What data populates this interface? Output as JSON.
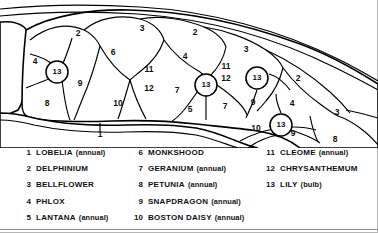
{
  "diagram": {
    "path_label": "1",
    "beds": [
      {
        "id": "b1",
        "label": "4",
        "x": 35,
        "y": 62
      },
      {
        "id": "b2",
        "label": "2",
        "x": 78,
        "y": 34
      },
      {
        "id": "b3",
        "label": "3",
        "x": 142,
        "y": 29
      },
      {
        "id": "b4",
        "label": "2",
        "x": 195,
        "y": 33
      },
      {
        "id": "b5",
        "label": "3",
        "x": 246,
        "y": 50
      },
      {
        "id": "b6",
        "label": "6",
        "x": 113,
        "y": 53
      },
      {
        "id": "b7",
        "label": "4",
        "x": 185,
        "y": 57
      },
      {
        "id": "b8",
        "label": "11",
        "x": 149,
        "y": 70
      },
      {
        "id": "b9",
        "label": "12",
        "x": 149,
        "y": 89
      },
      {
        "id": "b10",
        "label": "11",
        "x": 226,
        "y": 67
      },
      {
        "id": "b11",
        "label": "12",
        "x": 226,
        "y": 79
      },
      {
        "id": "b12",
        "label": "9",
        "x": 80,
        "y": 84
      },
      {
        "id": "b13",
        "label": "8",
        "x": 47,
        "y": 104
      },
      {
        "id": "b14",
        "label": "10",
        "x": 118,
        "y": 104
      },
      {
        "id": "b15",
        "label": "7",
        "x": 177,
        "y": 91
      },
      {
        "id": "b16",
        "label": "5",
        "x": 190,
        "y": 110
      },
      {
        "id": "b17",
        "label": "7",
        "x": 225,
        "y": 107
      },
      {
        "id": "b18",
        "label": "9",
        "x": 253,
        "y": 103
      },
      {
        "id": "b19",
        "label": "2",
        "x": 298,
        "y": 79
      },
      {
        "id": "b20",
        "label": "4",
        "x": 292,
        "y": 104
      },
      {
        "id": "b21",
        "label": "3",
        "x": 337,
        "y": 113
      },
      {
        "id": "b22",
        "label": "10",
        "x": 256,
        "y": 129
      },
      {
        "id": "b23",
        "label": "9",
        "x": 293,
        "y": 134
      },
      {
        "id": "b24",
        "label": "8",
        "x": 335,
        "y": 140
      }
    ],
    "bulbs": [
      {
        "id": "u1",
        "label": "13",
        "x": 57,
        "y": 72
      },
      {
        "id": "u2",
        "label": "13",
        "x": 206,
        "y": 85
      },
      {
        "id": "u3",
        "label": "13",
        "x": 257,
        "y": 78
      },
      {
        "id": "u4",
        "label": "13",
        "x": 281,
        "y": 125
      }
    ]
  },
  "legend": {
    "columns": [
      {
        "id": "column-1",
        "entries": [
          {
            "num": "1",
            "name": "LOBELIA",
            "note": "(annual)"
          },
          {
            "num": "2",
            "name": "DELPHINIUM",
            "note": ""
          },
          {
            "num": "3",
            "name": "BELLFLOWER",
            "note": ""
          },
          {
            "num": "4",
            "name": "PHLOX",
            "note": ""
          },
          {
            "num": "5",
            "name": "LANTANA",
            "note": "(annual)"
          }
        ]
      },
      {
        "id": "column-2",
        "entries": [
          {
            "num": "6",
            "name": "MONKSHOOD",
            "note": ""
          },
          {
            "num": "7",
            "name": "GERANIUM",
            "note": "(annual)"
          },
          {
            "num": "8",
            "name": "PETUNIA",
            "note": "(annual)"
          },
          {
            "num": "9",
            "name": "SNAPDRAGON",
            "note": "(annual)"
          },
          {
            "num": "10",
            "name": "BOSTON DAISY",
            "note": "(annual)"
          }
        ]
      },
      {
        "id": "column-3",
        "entries": [
          {
            "num": "11",
            "name": "CLEOME",
            "note": "(annual)"
          },
          {
            "num": "12",
            "name": "CHRYSANTHEMUM",
            "note": ""
          },
          {
            "num": "13",
            "name": "LILY",
            "note": "(bulb)"
          }
        ]
      }
    ]
  },
  "colors": {
    "ink": "#000000",
    "paper": "#ffffff",
    "frame": "#b4b4b4"
  }
}
